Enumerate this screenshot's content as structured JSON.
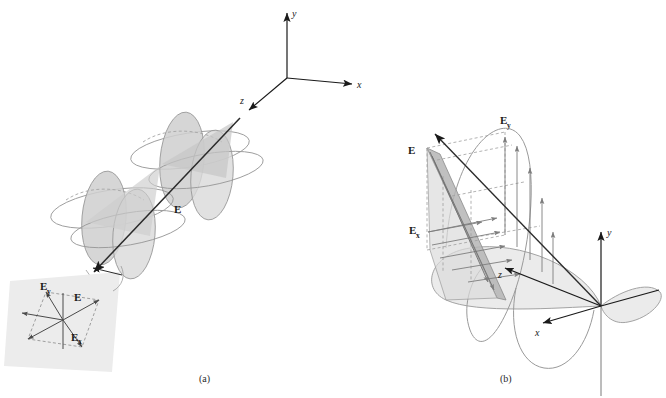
{
  "figure": {
    "background": "#ffffff",
    "ink": "#1a1a1a",
    "curve_color": "#8f8f8f",
    "fill_light": "#e3e3e3",
    "fill_mid": "#cfcfcf",
    "fill_dark": "#bdbdbd",
    "inset_bg": "#ededed"
  },
  "panel_a": {
    "caption": "(a)",
    "axes": {
      "x_label": "x",
      "y_label": "y",
      "z_label": "z",
      "origin": {
        "x": 287,
        "y": 78
      }
    },
    "field_label": "E",
    "inset": {
      "labels": {
        "resultant": "E",
        "x_component_base": "E",
        "x_component_sub": "x",
        "y_component_base": "E",
        "y_component_sub": "y"
      }
    }
  },
  "panel_b": {
    "caption": "(b)",
    "axes": {
      "x_label": "x",
      "y_label": "y",
      "z_label": "z",
      "origin": {
        "x": 601,
        "y": 306
      }
    },
    "labels": {
      "resultant": "E",
      "x_component_base": "E",
      "x_component_sub": "x",
      "y_component_base": "E",
      "y_component_sub": "y"
    }
  }
}
